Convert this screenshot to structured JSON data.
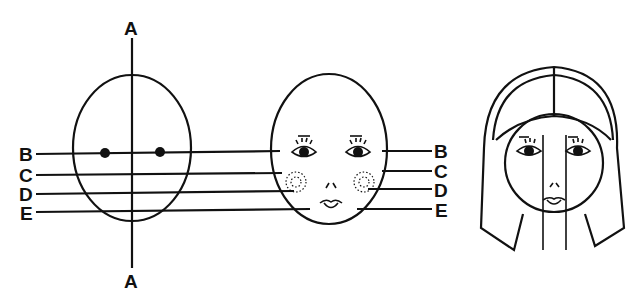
{
  "diagram": {
    "type": "face-proportion-guide",
    "panels": [
      {
        "id": "oval-guide",
        "description": "Oval with vertical axis A-A and horizontal guide lines B-E"
      },
      {
        "id": "face-guide",
        "description": "Face with eyes, cheeks, nose, mouth aligned to lines B-E"
      },
      {
        "id": "face-with-hair",
        "description": "Face with hair and vertical centre guides"
      }
    ],
    "labels": {
      "axis_top": "A",
      "axis_bottom": "A",
      "left": [
        "B",
        "C",
        "D",
        "E"
      ],
      "right": [
        "B",
        "C",
        "D",
        "E"
      ]
    },
    "colors": {
      "ink": "#111111",
      "background": "#ffffff"
    }
  }
}
